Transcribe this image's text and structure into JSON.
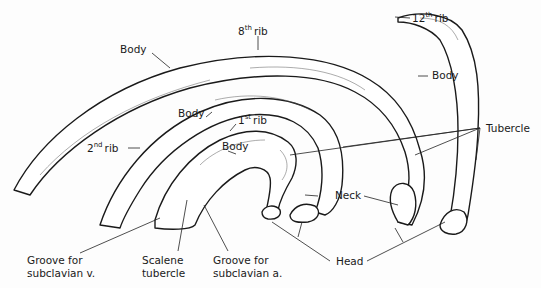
{
  "diagram": {
    "labels": {
      "rib8_body": "Body",
      "rib8_num": "8",
      "rib8_sup": "th",
      "rib8_word": "rib",
      "rib12_num": "12",
      "rib12_sup": "th",
      "rib12_word": "rib",
      "rib12_body": "Body",
      "rib2_body": "Body",
      "rib2_num": "2",
      "rib2_sup": "nd",
      "rib2_word": "rib",
      "rib1_num": "1",
      "rib1_sup": "st",
      "rib1_word": "rib",
      "rib1_body": "Body",
      "tubercle": "Tubercle",
      "neck": "Neck",
      "head": "Head",
      "groove_v_line1": "Groove for",
      "groove_v_line2": "subclavian v.",
      "scalene_line1": "Scalene",
      "scalene_line2": "tubercle",
      "groove_a_line1": "Groove for",
      "groove_a_line2": "subclavian a."
    }
  }
}
